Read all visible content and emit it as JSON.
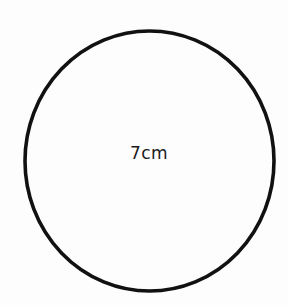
{
  "diagram": {
    "shape": "circle",
    "label": "7cm",
    "measurement": {
      "value": 7,
      "unit": "cm"
    },
    "stroke_color": "#111111",
    "background_color": "#fdfdfd"
  }
}
